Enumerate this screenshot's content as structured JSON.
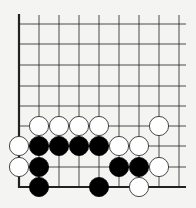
{
  "board": {
    "columns": 9,
    "rows": 9,
    "edges": [
      "left",
      "bottom"
    ],
    "background": "#f4f4f2",
    "line_color": "#222222",
    "black_color": "#000000",
    "white_fill": "#ffffff"
  },
  "stones": [
    {
      "color": "white",
      "col": 1,
      "row": 5
    },
    {
      "color": "white",
      "col": 2,
      "row": 5
    },
    {
      "color": "white",
      "col": 3,
      "row": 5
    },
    {
      "color": "white",
      "col": 4,
      "row": 5
    },
    {
      "color": "white",
      "col": 7,
      "row": 5
    },
    {
      "color": "white",
      "col": 0,
      "row": 6
    },
    {
      "color": "black",
      "col": 1,
      "row": 6
    },
    {
      "color": "black",
      "col": 2,
      "row": 6
    },
    {
      "color": "black",
      "col": 3,
      "row": 6
    },
    {
      "color": "black",
      "col": 4,
      "row": 6
    },
    {
      "color": "white",
      "col": 5,
      "row": 6
    },
    {
      "color": "white",
      "col": 6,
      "row": 6
    },
    {
      "color": "white",
      "col": 0,
      "row": 7
    },
    {
      "color": "black",
      "col": 1,
      "row": 7
    },
    {
      "color": "black",
      "col": 5,
      "row": 7
    },
    {
      "color": "black",
      "col": 6,
      "row": 7
    },
    {
      "color": "white",
      "col": 7,
      "row": 7
    },
    {
      "color": "black",
      "col": 1,
      "row": 8
    },
    {
      "color": "black",
      "col": 4,
      "row": 8
    },
    {
      "color": "white",
      "col": 6,
      "row": 8
    }
  ]
}
